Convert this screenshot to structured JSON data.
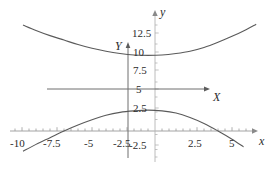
{
  "figure": {
    "title": "",
    "background_color": "#ffffff",
    "curve_color": "#555555",
    "primary_axis_color": "#555555",
    "secondary_axis_color": "#aaaaaa",
    "text_color": "#2b2b2b"
  },
  "axis_names": {
    "x_lower": "x",
    "y_lower": "y",
    "X_upper": "X",
    "Y_upper": "Y"
  },
  "chart_data": {
    "type": "line",
    "title": "",
    "xlabel": "x",
    "ylabel": "y",
    "grid": false,
    "legend": "none",
    "xlim": [
      -11.0,
      7.8
    ],
    "ylim": [
      -3.6,
      14.1
    ],
    "xticks": [
      -10,
      -7.5,
      -5,
      -2.5,
      2.5,
      5
    ],
    "xticklabels": [
      "-10",
      "-7.5",
      "-5",
      "-2.5",
      "2.5",
      "5"
    ],
    "yticks": [
      12.5,
      10,
      7.5,
      5,
      2.5,
      -2.5
    ],
    "yticklabels": [
      "12.5",
      "10",
      "7.5",
      "5",
      "2.5",
      "-2.5"
    ],
    "minor_tick_spacing_x": 0.5,
    "minor_tick_spacing_y": 0.5,
    "translated_origin": {
      "X": -0.5,
      "Y": 5
    },
    "series": [
      {
        "name": "upper-branch",
        "comment": "upper hyperbola branch, vertex near (-0.5, 9.6)",
        "points": [
          [
            -9.4,
            13.6
          ],
          [
            -8.5,
            12.9
          ],
          [
            -7.5,
            12.2
          ],
          [
            -6.5,
            11.6
          ],
          [
            -5.5,
            11.0
          ],
          [
            -4.5,
            10.5
          ],
          [
            -3.5,
            10.1
          ],
          [
            -2.5,
            9.8
          ],
          [
            -1.5,
            9.6
          ],
          [
            -0.5,
            9.55
          ],
          [
            0.5,
            9.6
          ],
          [
            1.5,
            9.8
          ],
          [
            2.5,
            10.1
          ],
          [
            3.5,
            10.6
          ],
          [
            4.5,
            11.3
          ],
          [
            5.5,
            12.1
          ],
          [
            6.5,
            13.0
          ],
          [
            7.2,
            13.7
          ]
        ]
      },
      {
        "name": "lower-branch",
        "comment": "lower hyperbola branch, vertex near (-0.5, 2.2)",
        "points": [
          [
            -9.4,
            -3.3
          ],
          [
            -8.5,
            -2.4
          ],
          [
            -7.5,
            -1.5
          ],
          [
            -6.5,
            -0.6
          ],
          [
            -5.5,
            0.2
          ],
          [
            -4.5,
            0.9
          ],
          [
            -3.5,
            1.5
          ],
          [
            -2.5,
            1.9
          ],
          [
            -1.5,
            2.1
          ],
          [
            -0.5,
            2.2
          ],
          [
            0.5,
            2.1
          ],
          [
            1.5,
            1.8
          ],
          [
            2.5,
            1.2
          ],
          [
            3.5,
            0.4
          ],
          [
            4.5,
            -0.6
          ],
          [
            5.5,
            -1.7
          ],
          [
            6.3,
            -2.7
          ]
        ]
      }
    ]
  },
  "tick_labels": {
    "x": [
      {
        "text": "-10",
        "px": 22,
        "py": 143
      },
      {
        "text": "-7.5",
        "px": 57,
        "py": 143
      },
      {
        "text": "-5",
        "px": 92,
        "py": 143
      },
      {
        "text": "-2.5",
        "px": 127,
        "py": 143
      },
      {
        "text": "2.5",
        "px": 197,
        "py": 143
      },
      {
        "text": "5",
        "px": 232,
        "py": 143
      }
    ],
    "y": [
      {
        "text": "12.5",
        "px": 138,
        "py": 33
      },
      {
        "text": "10",
        "px": 138,
        "py": 52
      },
      {
        "text": "7.5",
        "px": 138,
        "py": 70
      },
      {
        "text": "5",
        "px": 138,
        "py": 89
      },
      {
        "text": "2.5",
        "px": 138,
        "py": 108
      },
      {
        "text": "-2.5",
        "px": 138,
        "py": 145
      }
    ]
  }
}
